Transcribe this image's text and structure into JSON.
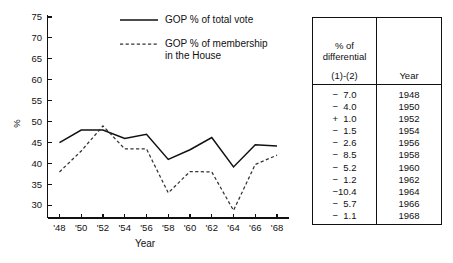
{
  "chart_data": {
    "type": "line",
    "title": "",
    "xlabel": "Year",
    "ylabel": "%",
    "x": [
      1948,
      1950,
      1952,
      1954,
      1956,
      1958,
      1960,
      1962,
      1964,
      1966,
      1968
    ],
    "x_tick_labels": [
      "'48",
      "'50",
      "'52",
      "'54",
      "'56",
      "'58",
      "'60",
      "'62",
      "'64",
      "'66",
      "'68"
    ],
    "y_tick_labels": [
      "30",
      "35",
      "40",
      "45",
      "50",
      "55",
      "60",
      "65",
      "70",
      "75"
    ],
    "y_ticks": [
      30,
      35,
      40,
      45,
      50,
      55,
      60,
      65,
      70,
      75
    ],
    "ylim": [
      27,
      75
    ],
    "xlim": [
      1947,
      1969
    ],
    "grid": false,
    "legend_position": "top-center",
    "series": [
      {
        "name": "GOP % of total vote",
        "style": "solid",
        "values": [
          45.0,
          48.0,
          48.0,
          46.0,
          47.0,
          41.0,
          43.3,
          46.2,
          39.2,
          44.5,
          44.2
        ]
      },
      {
        "name": "GOP % of membership\nin the House",
        "style": "dashed",
        "values": [
          38.0,
          43.0,
          49.0,
          43.5,
          43.5,
          33.0,
          38.1,
          38.0,
          28.8,
          39.8,
          42.0
        ]
      }
    ],
    "annotations": []
  },
  "legend": {
    "items": [
      {
        "label": "GOP % of total vote",
        "style": "solid",
        "swatch_name": "legend-swatch-solid"
      },
      {
        "label": "GOP % of membership\nin the House",
        "style": "dashed",
        "swatch_name": "legend-swatch-dashed"
      }
    ]
  },
  "axes": {
    "y_title": "%",
    "x_title": "Year"
  },
  "table": {
    "header": {
      "diff_line1": "% of",
      "diff_line2": "differential",
      "diff_sub": "(1)-(2)",
      "year": "Year"
    },
    "columns": [
      "% of differential (1)-(2)",
      "Year"
    ],
    "rows": [
      {
        "diff": "−  7.0",
        "year": "1948"
      },
      {
        "diff": "−  4.0",
        "year": "1950"
      },
      {
        "diff": "+  1.0",
        "year": "1952"
      },
      {
        "diff": "−  1.5",
        "year": "1954"
      },
      {
        "diff": "−  2.6",
        "year": "1956"
      },
      {
        "diff": "−  8.5",
        "year": "1958"
      },
      {
        "diff": "−  5.2",
        "year": "1960"
      },
      {
        "diff": "−  1.2",
        "year": "1962"
      },
      {
        "diff": "−10.4",
        "year": "1964"
      },
      {
        "diff": "−  5.7",
        "year": "1966"
      },
      {
        "diff": "−  1.1",
        "year": "1968"
      }
    ]
  },
  "colors": {
    "ink": "#111111",
    "background": "#ffffff"
  }
}
